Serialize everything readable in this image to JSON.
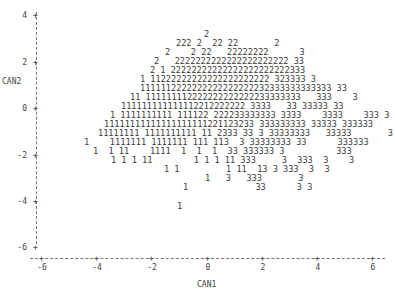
{
  "chart_data": {
    "type": "scatter",
    "title": "",
    "xlabel": "CAN1",
    "ylabel": "CAN2",
    "xlim": [
      -6.3,
      6.3
    ],
    "ylim": [
      -6.3,
      4.3
    ],
    "x_ticks": [
      "-6",
      "-4",
      "-2",
      "0",
      "2",
      "4",
      "6"
    ],
    "y_ticks": [
      "4",
      "2",
      "0",
      "-2",
      "-4",
      "-6"
    ],
    "legend": "Plotted symbols are group numbers: 1, 2, 3",
    "series": [
      {
        "name": "1",
        "description": "Group 1 observations, centered near CAN1 -2, CAN2 -1"
      },
      {
        "name": "2",
        "description": "Group 2 observations, centered near CAN1 0, CAN2 1.5"
      },
      {
        "name": "3",
        "description": "Group 3 observations, centered near CAN1 3, CAN2 -1"
      }
    ],
    "text_rows": [
      {
        "y": 3.3,
        "col": 30,
        "text": "2"
      },
      {
        "y": 2.95,
        "col": 24,
        "text": "222 2  22 22       2"
      },
      {
        "y": 2.6,
        "col": 21,
        "text": "2     2 22   22222222      3"
      },
      {
        "y": 2.25,
        "col": 20,
        "text": "2   2222222222222222222222 33"
      },
      {
        "y": 1.9,
        "col": 19,
        "text": "2 1 22222222222222222222222333"
      },
      {
        "y": 1.55,
        "col": 18,
        "text": "1 11222222222222222222222 323333 3"
      },
      {
        "y": 1.2,
        "col": 19,
        "text": "1111112222222222222222232333333333333 33"
      },
      {
        "y": 0.85,
        "col": 16,
        "text": "11 111111112222222222222233333333   333    3"
      },
      {
        "y": 0.5,
        "col": 15,
        "text": "111111111111112212222222 3333   33 33333 33"
      },
      {
        "y": 0.15,
        "col": 13,
        "text": "1 1111111111 111122 222233333333 3333    3333    333 3"
      },
      {
        "y": -0.2,
        "col": 12,
        "text": "11111111111111111111221123233 333333333 33333 333333"
      },
      {
        "y": -0.55,
        "col": 11,
        "text": "11111111 1111111111 11 2333 33 3 33333333   33333       3"
      },
      {
        "y": -0.9,
        "col": 7,
        "text": "1    1111111 1111111 111 113  3 33333333 33      333333"
      },
      {
        "y": -1.25,
        "col": 8,
        "text": "1  1 11    1111  1  1  1  33 333333 3          333"
      },
      {
        "y": -1.6,
        "col": 10,
        "text": "1 1 1 11        1 1 1 11 333     3  333  3    3"
      },
      {
        "y": -1.95,
        "col": 19,
        "text": "1 1         1 11  13 3 333  3  3"
      },
      {
        "y": -2.3,
        "col": 27,
        "text": "1   3   333       3"
      },
      {
        "y": -2.65,
        "col": 18,
        "text": "1             33      3 3"
      },
      {
        "y": -3.0,
        "col": 0,
        "text": ""
      },
      {
        "y": -3.35,
        "col": 17,
        "text": "1"
      }
    ]
  },
  "plot": {
    "ylabel": "CAN2",
    "xlabel": "CAN1",
    "y_ticks": [
      {
        "label": "4",
        "y": 16
      },
      {
        "label": "2",
        "y": 63
      },
      {
        "label": "0",
        "y": 109
      },
      {
        "label": "-2",
        "y": 156
      },
      {
        "label": "-4",
        "y": 202
      },
      {
        "label": "-6",
        "y": 248
      }
    ],
    "x_ticks": [
      {
        "label": "-6",
        "x": 42
      },
      {
        "label": "-4",
        "x": 97
      },
      {
        "label": "-2",
        "x": 152
      },
      {
        "label": "0",
        "x": 208
      },
      {
        "label": "2",
        "x": 263
      },
      {
        "label": "4",
        "x": 318
      },
      {
        "label": "6",
        "x": 373
      }
    ],
    "rows": [
      {
        "x": 204,
        "y": 35,
        "text": "2"
      },
      {
        "x": 176,
        "y": 44,
        "text": "222 2  22 22       2"
      },
      {
        "x": 165,
        "y": 53,
        "text": "2    2 22   22222222      3"
      },
      {
        "x": 154,
        "y": 62,
        "text": "2   2222222222222222222222 33"
      },
      {
        "x": 150,
        "y": 71,
        "text": "2 1 22222222222222222222222333"
      },
      {
        "x": 140,
        "y": 80,
        "text": "1 11222222222222222222222 323333 3"
      },
      {
        "x": 140,
        "y": 89,
        "text": "1111112222222222222222232333333333333 33"
      },
      {
        "x": 130,
        "y": 98,
        "text": "11 111111112222222222222233333333   333    3"
      },
      {
        "x": 121,
        "y": 107,
        "text": "111111111111112212222222 3333   33 33333 33"
      },
      {
        "x": 110,
        "y": 116,
        "text": "1 1111111111 111122 222233333333 3333    3333    333 3"
      },
      {
        "x": 104,
        "y": 125,
        "text": "11111111111111111111221123233 333333333 33333 333333"
      },
      {
        "x": 98,
        "y": 134,
        "text": "11111111 1111111111 11 2333 33 3 33333333   33333       3"
      },
      {
        "x": 84,
        "y": 143,
        "text": "1    1111111 1111111 111 113  3 33333333 33      333333"
      },
      {
        "x": 93,
        "y": 152,
        "text": "1  1 11    1111  1  1  1  33 333333 3          333"
      },
      {
        "x": 111,
        "y": 161,
        "text": "1 1 1 11        1 1 1 11 333     3  333  3    3"
      },
      {
        "x": 164,
        "y": 170,
        "text": "1 1         1 11  13 3 333  3  3"
      },
      {
        "x": 205,
        "y": 179,
        "text": "1   3   333       3"
      },
      {
        "x": 183,
        "y": 188,
        "text": "1             33      3 3"
      },
      {
        "x": 177,
        "y": 207,
        "text": "1"
      }
    ]
  }
}
